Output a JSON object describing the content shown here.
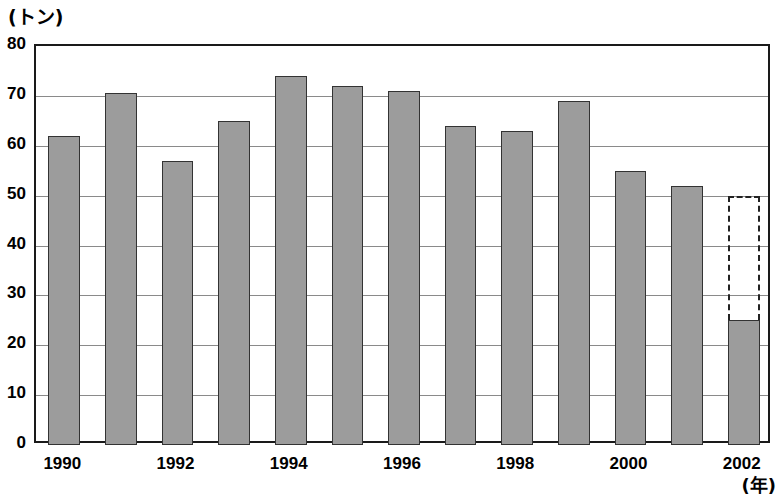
{
  "chart_data": {
    "type": "bar",
    "title": "",
    "subtitle": "",
    "xlabel": "(年)",
    "ylabel": "(トン)",
    "y_unit_label": "(トン)",
    "x_unit_label": "(年)",
    "categories": [
      "1990",
      "1991",
      "1992",
      "1993",
      "1994",
      "1995",
      "1996",
      "1997",
      "1998",
      "1999",
      "2000",
      "2001",
      "2002"
    ],
    "values": [
      62,
      70.5,
      57,
      65,
      74,
      72,
      71,
      64,
      63,
      69,
      55,
      52,
      25
    ],
    "series": [
      {
        "name": "実績",
        "values": [
          62,
          70.5,
          57,
          65,
          74,
          72,
          71,
          64,
          63,
          69,
          55,
          52,
          25
        ]
      },
      {
        "name": "見込み (破線)",
        "values": [
          null,
          null,
          null,
          null,
          null,
          null,
          null,
          null,
          null,
          null,
          null,
          null,
          50
        ]
      }
    ],
    "projection": {
      "category": "2002",
      "from": 25,
      "to": 50,
      "style": "dashed-outline"
    },
    "ylim": [
      0,
      80
    ],
    "ytick_values": [
      0,
      10,
      20,
      30,
      40,
      50,
      60,
      70,
      80
    ],
    "ytick_labels": [
      "0",
      "10",
      "20",
      "30",
      "40",
      "50",
      "60",
      "70",
      "80"
    ],
    "xtick_labels": [
      "1990",
      "1992",
      "1994",
      "1996",
      "1998",
      "2000",
      "2002"
    ],
    "xtick_categories": [
      "1990",
      "1992",
      "1994",
      "1996",
      "1998",
      "2000",
      "2002"
    ],
    "grid": true,
    "legend": false,
    "legend_position": "none",
    "bar_fill_color": "#9c9c9c",
    "bar_border_color": "#333333",
    "grid_color": "#8a8a8a",
    "frame_color": "#1a1a1a",
    "background_color": "#ffffff"
  }
}
